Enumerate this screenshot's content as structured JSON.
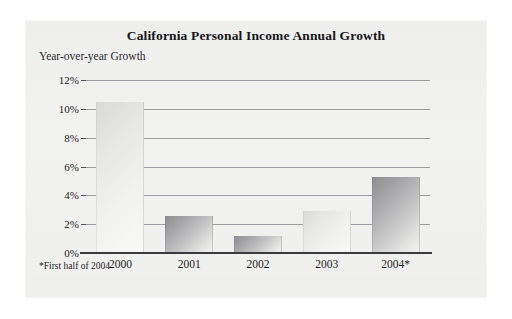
{
  "chart_data": {
    "type": "bar",
    "title": "California Personal Income Annual Growth",
    "subtitle": "Year-over-year Growth",
    "xlabel": "",
    "ylabel": "",
    "categories": [
      "2000",
      "2001",
      "2002",
      "2003",
      "2004*"
    ],
    "values": [
      10.5,
      2.6,
      1.2,
      2.9,
      5.3
    ],
    "ylim": [
      0,
      12
    ],
    "yticks": [
      0,
      2,
      4,
      6,
      8,
      10,
      12
    ],
    "ytick_labels": [
      "0%",
      "2%",
      "4%",
      "6%",
      "8%",
      "10%",
      "12%"
    ],
    "grid": true,
    "legend": null,
    "footnote": "*First half of 2004",
    "bar_styles": [
      "light",
      "dark",
      "dark",
      "light",
      "dark"
    ],
    "colors": {
      "panel_background": "#f0f0ef",
      "gridline": "#8d8d93",
      "axis": "#3a3a3f",
      "text": "#1d1d21",
      "bar_light_start": "#d9d9d7",
      "bar_light_end": "#f8f8f7",
      "bar_dark_start": "#8e8e92",
      "bar_dark_end": "#f2f2f1"
    }
  }
}
